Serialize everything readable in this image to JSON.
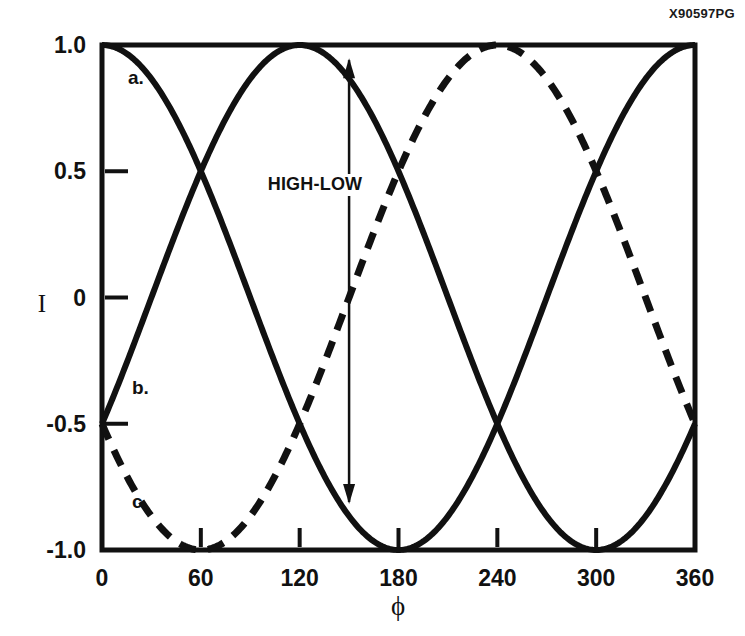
{
  "figure": {
    "id_code": "X90597PG"
  },
  "chart_data": {
    "type": "line",
    "title": "",
    "subtitle": "",
    "xlabel": "ϕ",
    "ylabel": "I",
    "xlim": [
      0,
      360
    ],
    "ylim": [
      -1.0,
      1.0
    ],
    "grid": false,
    "legend_position": "inline-curve-labels",
    "x_ticks": [
      0,
      60,
      120,
      180,
      240,
      300,
      360
    ],
    "x_tick_labels": [
      "0",
      "60",
      "120",
      "180",
      "240",
      "300",
      "360"
    ],
    "y_ticks": [
      1.0,
      0.5,
      0,
      -0.5,
      -1.0
    ],
    "y_tick_labels": [
      "1.0",
      "0.5",
      "0",
      "-0.5",
      "-1.0"
    ],
    "series": [
      {
        "name": "a.",
        "label": "a.",
        "style": "solid",
        "color": "#111111",
        "formula_phase_deg": 0,
        "amplitude": 1.0,
        "label_x": 128,
        "label_y": 84,
        "x": [
          0,
          15,
          30,
          45,
          60,
          75,
          90,
          105,
          120,
          135,
          150,
          165,
          180,
          195,
          210,
          225,
          240,
          255,
          270,
          285,
          300,
          315,
          330,
          345,
          360
        ],
        "y": [
          1.0,
          0.966,
          0.866,
          0.707,
          0.5,
          0.259,
          0.0,
          -0.259,
          -0.5,
          -0.707,
          -0.866,
          -0.966,
          -1.0,
          -0.966,
          -0.866,
          -0.707,
          -0.5,
          -0.259,
          0.0,
          0.259,
          0.5,
          0.707,
          0.866,
          0.966,
          1.0
        ]
      },
      {
        "name": "b.",
        "label": "b.",
        "style": "solid",
        "color": "#111111",
        "formula_phase_deg": 120,
        "amplitude": 1.0,
        "label_x": 132,
        "label_y": 394,
        "x": [
          0,
          15,
          30,
          45,
          60,
          75,
          90,
          105,
          120,
          135,
          150,
          165,
          180,
          195,
          210,
          225,
          240,
          255,
          270,
          285,
          300,
          315,
          330,
          345,
          360
        ],
        "y": [
          -0.5,
          -0.259,
          0.0,
          0.259,
          0.5,
          0.707,
          0.866,
          0.966,
          1.0,
          0.966,
          0.866,
          0.707,
          0.5,
          0.259,
          0.0,
          -0.259,
          -0.5,
          -0.707,
          -0.866,
          -0.966,
          -1.0,
          -0.966,
          -0.866,
          -0.707,
          -0.5
        ]
      },
      {
        "name": "c.",
        "label": "c.",
        "style": "dashed",
        "color": "#111111",
        "formula_phase_deg": 240,
        "amplitude": 1.0,
        "label_x": 132,
        "label_y": 508,
        "x": [
          0,
          15,
          30,
          45,
          60,
          75,
          90,
          105,
          120,
          135,
          150,
          165,
          180,
          195,
          210,
          225,
          240,
          255,
          270,
          285,
          300,
          315,
          330,
          345,
          360
        ],
        "y": [
          -0.5,
          -0.707,
          -0.866,
          -0.966,
          -1.0,
          -0.966,
          -0.866,
          -0.707,
          -0.5,
          -0.259,
          0.0,
          0.259,
          0.5,
          0.707,
          0.866,
          0.966,
          1.0,
          0.966,
          0.866,
          0.707,
          0.5,
          0.259,
          0.0,
          -0.259,
          -0.5
        ]
      }
    ],
    "annotations": [
      {
        "name": "high-low-arrow",
        "text": "HIGH-LOW",
        "x": 150,
        "y_top": 0.94,
        "y_bottom": -0.81,
        "text_x": 315,
        "text_y": 190,
        "arrow": "double"
      }
    ]
  }
}
